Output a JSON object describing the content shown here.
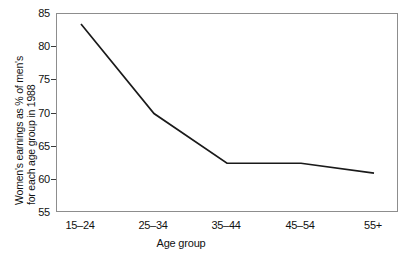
{
  "chart_data": {
    "type": "line",
    "title": "",
    "subtitle": "",
    "xlabel": "Age group",
    "ylabel": "Women's earnings as % of men's for each age group in 1988",
    "ylabel_lines": [
      "Women's earnings as % of men's",
      "for each age group in 1988"
    ],
    "categories": [
      "15–24",
      "25–34",
      "35–44",
      "45–54",
      "55+"
    ],
    "values": [
      83.5,
      70.0,
      62.5,
      62.5,
      61.0
    ],
    "series": [
      {
        "name": "Women's earnings as % of men's",
        "values": [
          83.5,
          70.0,
          62.5,
          62.5,
          61.0
        ]
      }
    ],
    "ylim": [
      55,
      85
    ],
    "yticks": [
      55,
      60,
      65,
      70,
      75,
      80,
      85
    ],
    "ytick_labels": [
      "55",
      "60",
      "65",
      "70",
      "75",
      "80",
      "85"
    ],
    "xlim": [
      -0.5,
      4.5
    ],
    "grid": false,
    "legend": false,
    "legend_position": "none",
    "line_color": "#1a1a1a",
    "frame_color": "#8d8d8d",
    "background": "#ffffff"
  }
}
